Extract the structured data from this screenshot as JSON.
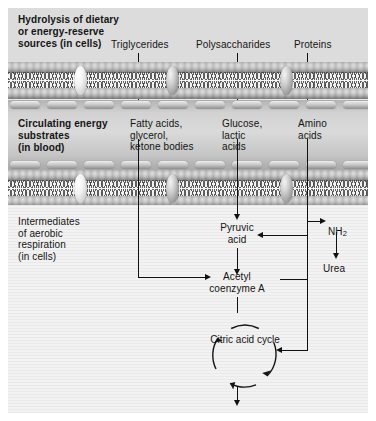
{
  "diagram": {
    "zones": {
      "hydrolysis": {
        "heading": "Hydrolysis of dietary\nor energy-reserve\nsources (in cells)",
        "substrates": [
          {
            "label": "Triglycerides"
          },
          {
            "label": "Polysaccharides"
          },
          {
            "label": "Proteins"
          }
        ]
      },
      "blood": {
        "heading": "Circulating energy\nsubstrates\n(in blood)",
        "substrates": [
          {
            "label": "Fatty acids,\nglycerol,\nketone bodies"
          },
          {
            "label": "Glucose,\nlactic\nacids"
          },
          {
            "label": "Amino\nacids"
          }
        ]
      },
      "cell": {
        "heading": "Intermediates\nof aerobic\nrespiration\n(in cells)"
      }
    },
    "nodes": {
      "pyruvic_acid": "Pyruvic\nacid",
      "acetyl_coa": "Acetyl\ncoenzyme A",
      "citric_acid_cycle": "Citric\nacid\ncycle",
      "ammonia": "NH",
      "ammonia_sub": "2",
      "urea": "Urea",
      "products_co2": "CO",
      "products_co2_sub": "2",
      "products_plus1": " + H",
      "products_h2o_sub": "2",
      "products_o": "O",
      "products_plus2": " + ATP"
    },
    "colors": {
      "ink": "#141414",
      "connector": "#111111",
      "canvas": "#e9e9e9",
      "cell_interior": "#f2f2f2",
      "blood_channel": "#c9c9c9",
      "membrane_core": "#f4f4f4"
    }
  }
}
